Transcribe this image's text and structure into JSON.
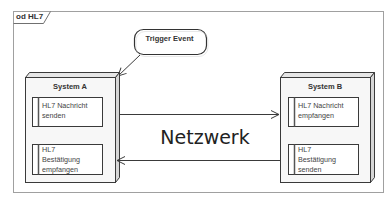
{
  "diagram": {
    "frame_label": "od HL7",
    "trigger": {
      "label": "Trigger Event"
    },
    "nodes": [
      {
        "title": "System A",
        "actions": [
          {
            "lines": [
              "HL7 Nachricht",
              "senden"
            ]
          },
          {
            "lines": [
              "HL7",
              "Bestätigung",
              "empfangen"
            ]
          }
        ]
      },
      {
        "title": "System B",
        "actions": [
          {
            "lines": [
              "HL7 Nachricht",
              "empfangen"
            ]
          },
          {
            "lines": [
              "HL7",
              "Bestätigung",
              "senden"
            ]
          }
        ]
      }
    ],
    "network_label": "Netzwerk",
    "colors": {
      "stroke": "#3a3a3a",
      "node_fill": "#f7f7f7",
      "node_side": "#d8d8d8",
      "frame_stroke": "#9a9a9a",
      "action_bar": "#555555"
    }
  }
}
